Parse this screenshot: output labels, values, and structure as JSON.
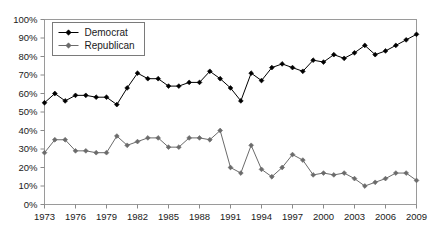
{
  "chart_data": {
    "type": "line",
    "title": "",
    "subtitle": "",
    "xlabel": "",
    "ylabel": "",
    "xlim": [
      1973,
      2009
    ],
    "ylim": [
      0,
      100
    ],
    "grid": false,
    "legend_position": "top-left",
    "y_ticks": [
      "0%",
      "10%",
      "20%",
      "30%",
      "40%",
      "50%",
      "60%",
      "70%",
      "80%",
      "90%",
      "100%"
    ],
    "y_tick_values": [
      0,
      10,
      20,
      30,
      40,
      50,
      60,
      70,
      80,
      90,
      100
    ],
    "x_ticks": [
      "1973",
      "1976",
      "1979",
      "1982",
      "1985",
      "1988",
      "1991",
      "1994",
      "1997",
      "2000",
      "2003",
      "2006",
      "2009"
    ],
    "x_tick_values": [
      1973,
      1976,
      1979,
      1982,
      1985,
      1988,
      1991,
      1994,
      1997,
      2000,
      2003,
      2006,
      2009
    ],
    "x": [
      1973,
      1974,
      1975,
      1976,
      1977,
      1978,
      1979,
      1980,
      1981,
      1982,
      1983,
      1984,
      1985,
      1986,
      1987,
      1988,
      1989,
      1990,
      1991,
      1992,
      1993,
      1994,
      1995,
      1996,
      1997,
      1998,
      1999,
      2000,
      2001,
      2002,
      2003,
      2004,
      2005,
      2006,
      2007,
      2008,
      2009
    ],
    "series": [
      {
        "name": "Democrat",
        "color": "#000000",
        "marker": "diamond",
        "values": [
          55,
          60,
          56,
          59,
          59,
          58,
          58,
          54,
          63,
          71,
          68,
          68,
          64,
          64,
          66,
          66,
          72,
          68,
          63,
          56,
          71,
          67,
          74,
          76,
          74,
          72,
          78,
          77,
          81,
          79,
          82,
          86,
          81,
          83,
          86,
          89,
          92
        ]
      },
      {
        "name": "Republican",
        "color": "#6b6b6b",
        "marker": "diamond",
        "values": [
          28,
          35,
          35,
          29,
          29,
          28,
          28,
          37,
          32,
          34,
          36,
          36,
          31,
          31,
          36,
          36,
          35,
          40,
          20,
          17,
          32,
          19,
          15,
          20,
          27,
          24,
          16,
          17,
          16,
          17,
          14,
          10,
          12,
          14,
          17,
          17,
          13
        ]
      }
    ]
  },
  "legend": {
    "items": [
      {
        "label": "Democrat"
      },
      {
        "label": "Republican"
      }
    ]
  },
  "colors": {
    "democrat": "#000000",
    "republican": "#6b6b6b",
    "axis": "#8a8a8a",
    "text": "#1a1a1a",
    "background": "#ffffff"
  }
}
